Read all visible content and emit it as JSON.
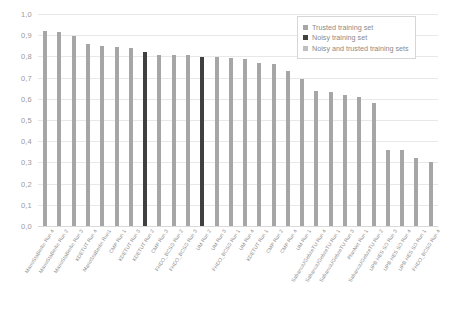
{
  "chart_data": {
    "type": "bar",
    "title": "",
    "xlabel": "",
    "ylabel": "",
    "ylim": [
      0,
      1.0
    ],
    "ytick_labels": [
      "1,0",
      "0,9",
      "0,8",
      "0,7",
      "0,6",
      "0,5",
      "0,4",
      "0,3",
      "0,2",
      "0,1",
      "0,0"
    ],
    "ytick_values": [
      1.0,
      0.9,
      0.8,
      0.7,
      0.6,
      0.5,
      0.4,
      0.3,
      0.2,
      0.1,
      0.0
    ],
    "grid": true,
    "legend_position": "top-right",
    "legend": [
      {
        "label": "Trusted training set",
        "color": "#a6a6a6"
      },
      {
        "label": "Noisy training set",
        "color": "#404040"
      },
      {
        "label": "Noisy and trusted training sets",
        "color": "#bfbfbf"
      }
    ],
    "categories": [
      "MarioStaBerlin Run 4",
      "MarioStaBerlin Run 2",
      "MarioStaBerlin Run 3",
      "KDETUT Run 4",
      "MarioStaBerlin Run1",
      "CMP Run 1",
      "KDETUT Run 3",
      "KDETUT Run 2",
      "CMP Run 3",
      "FHDO_BCSG Run 2",
      "FHDO_BCSG Run 3",
      "UM Run 2",
      "UM Run 3",
      "FHDO_BCSG Run 1",
      "UM Run 4",
      "KDETUT Run 1",
      "CMP Run 2",
      "CMP Run 4",
      "UM Run 1",
      "SabanciUGebzeTU Run 4",
      "SabanciUGebzeTU Run 1",
      "SabanciUGebzeTU Run 3",
      "PlanNet Run 1",
      "SabanciUGebzeTU Run 2",
      "UPB HES SO Run 3",
      "UPB HES SO Run 4",
      "UPB HES SO Run 1",
      "FHDO_BCSG Run 4"
    ],
    "values": [
      0.92,
      0.917,
      0.895,
      0.857,
      0.85,
      0.845,
      0.838,
      0.823,
      0.808,
      0.806,
      0.805,
      0.799,
      0.797,
      0.791,
      0.789,
      0.77,
      0.763,
      0.729,
      0.695,
      0.638,
      0.634,
      0.62,
      0.61,
      0.578,
      0.359,
      0.358,
      0.323,
      0.303
    ],
    "bar_series": [
      "trusted",
      "trusted",
      "trusted",
      "trusted",
      "trusted",
      "trusted",
      "trusted",
      "noisy",
      "trusted",
      "trusted",
      "trusted",
      "noisy",
      "trusted",
      "trusted",
      "trusted",
      "trusted",
      "trusted",
      "trusted",
      "trusted",
      "trusted",
      "trusted",
      "trusted",
      "trusted",
      "trusted",
      "trusted",
      "trusted",
      "trusted",
      "trusted"
    ]
  }
}
